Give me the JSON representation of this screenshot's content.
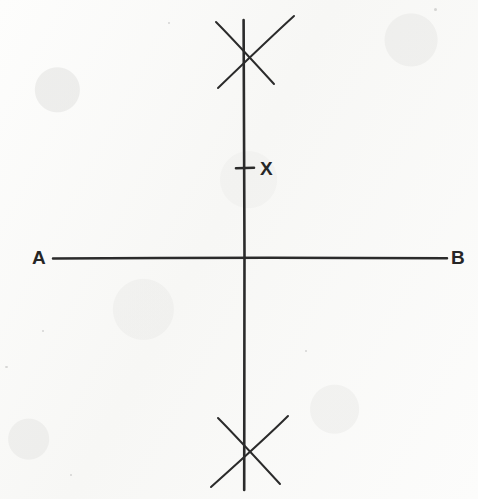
{
  "figure": {
    "kind": "geometric-construction-diagram",
    "medium": "hand-drawn pencil on paper",
    "background_color": "#fbfbfa",
    "ink_color": "#2b2b2b",
    "width": 478,
    "height": 499
  },
  "labels": {
    "left_endpoint": "A",
    "right_endpoint": "B",
    "marked_point": "X"
  },
  "elements": {
    "baseline": {
      "name": "line-AB",
      "from_label": "A",
      "to_label": "B",
      "x1": 53,
      "y1": 258,
      "x2": 447,
      "y2": 258
    },
    "perpendicular": {
      "name": "perpendicular-bisector",
      "x1": 244,
      "y1": 20,
      "x2": 244,
      "y2": 490
    },
    "intersection": {
      "x": 244,
      "y": 258
    },
    "upper_arc_crossing": {
      "x": 244,
      "y": 52
    },
    "lower_arc_crossing": {
      "x": 244,
      "y": 456
    },
    "tick_mark": {
      "name": "point-X-tick",
      "x1": 236,
      "y1": 168,
      "x2": 254,
      "y2": 168
    }
  }
}
